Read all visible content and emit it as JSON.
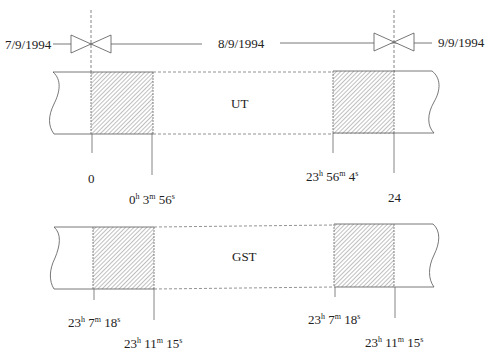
{
  "dates": {
    "left": "7/9/1994",
    "center": "8/9/1994",
    "right": "9/9/1994"
  },
  "bands": {
    "ut": {
      "label": "UT"
    },
    "gst": {
      "label": "GST"
    }
  },
  "ut_ticks": {
    "start": "0",
    "start_end": {
      "h": "0",
      "m": "3",
      "s": "56"
    },
    "end_start": {
      "h": "23",
      "m": "56",
      "s": "4"
    },
    "end": "24"
  },
  "gst_ticks": {
    "left_a": {
      "h": "23",
      "m": "7",
      "s": "18"
    },
    "left_b": {
      "h": "23",
      "m": "11",
      "s": "15"
    },
    "right_a": {
      "h": "23",
      "m": "7",
      "s": "18"
    },
    "right_b": {
      "h": "23",
      "m": "11",
      "s": "15"
    }
  },
  "units": {
    "h": "h",
    "m": "m",
    "s": "s"
  },
  "colors": {
    "line": "#555555",
    "hatch": "#888888",
    "text": "#222222"
  }
}
